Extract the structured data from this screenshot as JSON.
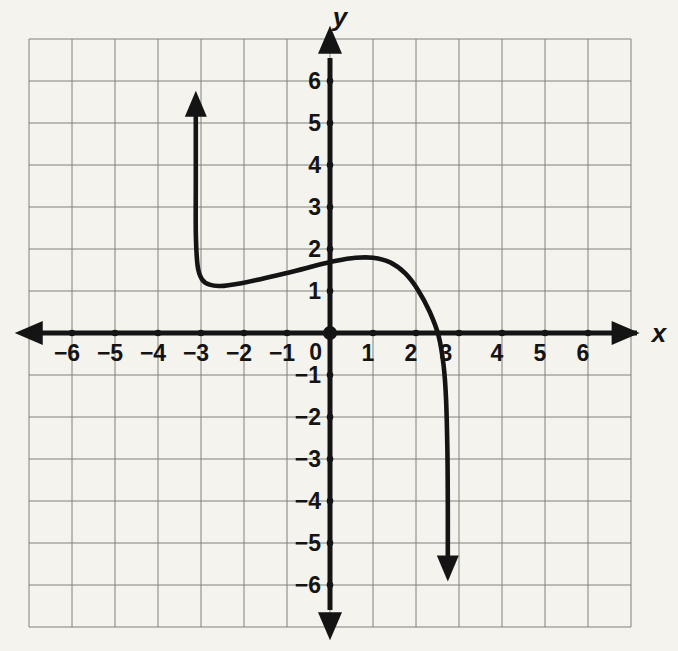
{
  "figure": {
    "width": 678,
    "height": 651,
    "background_color": "#f4f3ee",
    "grid_color": "#76746e",
    "axis_color": "#141414",
    "curve_color": "#141414",
    "text_color": "#141414"
  },
  "chart_data": {
    "type": "line",
    "title": "",
    "xlabel": "x",
    "ylabel": "y",
    "xlim": [
      -7,
      7
    ],
    "ylim": [
      -7,
      7
    ],
    "grid": true,
    "x_ticks": [
      -6,
      -5,
      -4,
      -3,
      -2,
      -1,
      1,
      2,
      3,
      4,
      5,
      6
    ],
    "y_ticks": [
      -6,
      -5,
      -4,
      -3,
      -2,
      -1,
      1,
      2,
      3,
      4,
      5,
      6
    ],
    "origin_label": "0",
    "axes": {
      "x_arrow_both_ends": true,
      "y_arrow_both_ends": true,
      "tick_dots": true,
      "origin_dot": true
    },
    "series": [
      {
        "name": "curve",
        "description": "Curve enters from above with an upward arrow at x ~ -3.1, drops almost vertically to a local minimum near (-2.5, 1.1), rises to a local maximum near (0.8, 1.8), crosses the x-axis near x ~ 2.5, then plunges almost vertically with a downward arrow at x ~ 2.75",
        "start_arrow": "up",
        "end_arrow": "down",
        "points": [
          [
            -3.12,
            5.15
          ],
          [
            -3.12,
            3.6
          ],
          [
            -3.12,
            2.4
          ],
          [
            -3.08,
            1.6
          ],
          [
            -2.98,
            1.28
          ],
          [
            -2.8,
            1.15
          ],
          [
            -2.55,
            1.12
          ],
          [
            -2.1,
            1.18
          ],
          [
            -1.55,
            1.3
          ],
          [
            -0.95,
            1.44
          ],
          [
            -0.35,
            1.6
          ],
          [
            0.15,
            1.72
          ],
          [
            0.6,
            1.79
          ],
          [
            1.0,
            1.79
          ],
          [
            1.4,
            1.68
          ],
          [
            1.75,
            1.42
          ],
          [
            2.05,
            1.02
          ],
          [
            2.32,
            0.5
          ],
          [
            2.52,
            -0.05
          ],
          [
            2.64,
            -0.75
          ],
          [
            2.7,
            -1.6
          ],
          [
            2.73,
            -2.8
          ],
          [
            2.74,
            -4.0
          ],
          [
            2.74,
            -5.3
          ]
        ]
      }
    ]
  }
}
